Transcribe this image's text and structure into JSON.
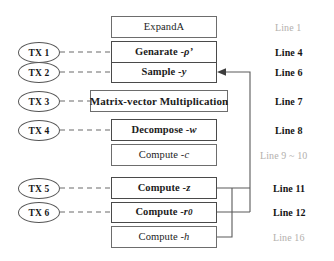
{
  "diagram": {
    "type": "flow-diagram",
    "canvas": {
      "width": 334,
      "height": 261
    },
    "colors": {
      "box_border": "#6d6d6d",
      "emph_border": "#4a4a4a",
      "oval_border": "#555555",
      "wire": "#5a5a5a",
      "dashed_wire": "#6a6a6a",
      "label_strong": "#141414",
      "label_faint": "#b3b0ad",
      "background": "#ffffff"
    },
    "nodes": [
      {
        "id": "expanda",
        "label": "ExpandA",
        "emphasis": "normal",
        "wide": false
      },
      {
        "id": "generate",
        "label": "Genarate - ",
        "sym": "ρ’",
        "emphasis": "bold",
        "wide": false
      },
      {
        "id": "sample",
        "label": "Sample - ",
        "sym": "y",
        "emphasis": "bold",
        "wide": false
      },
      {
        "id": "matmul",
        "label": "Matrix-vector Multiplication",
        "emphasis": "bold",
        "wide": true
      },
      {
        "id": "decompose",
        "label": "Decompose - ",
        "sym": "w",
        "emphasis": "bold",
        "wide": false
      },
      {
        "id": "computec",
        "label": "Compute - ",
        "sym": "c",
        "emphasis": "normal",
        "wide": false
      },
      {
        "id": "computez",
        "label": "Compute - ",
        "sym": "z",
        "emphasis": "bold",
        "wide": false
      },
      {
        "id": "computer0",
        "label": "Compute - ",
        "sym": "r",
        "sub": "0",
        "emphasis": "bold",
        "wide": false
      },
      {
        "id": "computeh",
        "label": "Compute - ",
        "sym": "h",
        "emphasis": "normal",
        "wide": false
      }
    ],
    "tx_nodes": [
      {
        "id": "tx1",
        "label": "TX 1",
        "target": "generate"
      },
      {
        "id": "tx2",
        "label": "TX 2",
        "target": "sample"
      },
      {
        "id": "tx3",
        "label": "TX 3",
        "target": "matmul"
      },
      {
        "id": "tx4",
        "label": "TX 4",
        "target": "decompose"
      },
      {
        "id": "tx5",
        "label": "TX 5",
        "target": "computez"
      },
      {
        "id": "tx6",
        "label": "TX 6",
        "target": "computer0"
      }
    ],
    "line_labels": [
      {
        "id": "l1",
        "text": "Line 1",
        "style": "faint",
        "row": "expanda"
      },
      {
        "id": "l4",
        "text": "Line 4",
        "style": "strong",
        "row": "generate"
      },
      {
        "id": "l6",
        "text": "Line 6",
        "style": "strong",
        "row": "sample"
      },
      {
        "id": "l7",
        "text": "Line 7",
        "style": "strong",
        "row": "matmul"
      },
      {
        "id": "l8",
        "text": "Line 8",
        "style": "strong",
        "row": "decompose"
      },
      {
        "id": "l910",
        "text": "Line 9 ~ 10",
        "style": "faint",
        "row": "computec"
      },
      {
        "id": "l11",
        "text": "Line 11",
        "style": "strong",
        "row": "computez"
      },
      {
        "id": "l12",
        "text": "Line 12",
        "style": "strong",
        "row": "computer0"
      },
      {
        "id": "l16",
        "text": "Line 16",
        "style": "faint",
        "row": "computeh"
      }
    ],
    "feedback": {
      "description": "Rejection-sampling feedback from Compute - z, Compute - r0 and Compute - h back to Sample - y",
      "sources": [
        "computez",
        "computer0",
        "computeh"
      ],
      "target": "sample",
      "arrowhead": "left"
    }
  }
}
